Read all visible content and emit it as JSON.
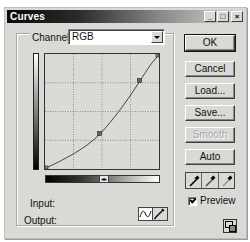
{
  "window": {
    "title": "Curves",
    "controls": {
      "minimize": "_",
      "maximize": "□",
      "close": "×"
    }
  },
  "channel": {
    "label": "Channel:",
    "value": "RGB"
  },
  "curve": {
    "grid_divisions": 4,
    "points": [
      {
        "input": 0,
        "output": 0
      },
      {
        "input": 120,
        "output": 81
      },
      {
        "input": 218,
        "output": 197
      },
      {
        "input": 255,
        "output": 255
      }
    ]
  },
  "labels": {
    "input": "Input:",
    "output": "Output:"
  },
  "buttons": {
    "ok": "OK",
    "cancel": "Cancel",
    "load": "Load...",
    "save": "Save...",
    "smooth": "Smooth",
    "auto": "Auto"
  },
  "eyedroppers": [
    "black-point",
    "gray-point",
    "white-point"
  ],
  "preview": {
    "label": "Preview",
    "checked": true
  },
  "mode": {
    "active": "curve",
    "options": [
      "curve",
      "pencil"
    ]
  }
}
